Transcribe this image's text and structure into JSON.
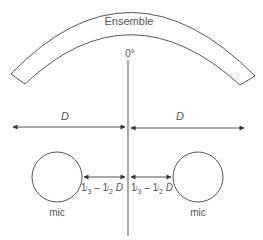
{
  "diagram": {
    "title": "Ensemble",
    "angle_label": "0°",
    "left_distance_label": "D",
    "right_distance_label": "D",
    "left_spacing": {
      "third": "1",
      "third_den": "3",
      "dash": " – ",
      "half": "1",
      "half_den": "2",
      "unit": " D"
    },
    "right_spacing": {
      "third": "1",
      "third_den": "3",
      "dash": " – ",
      "half": "1",
      "half_den": "2",
      "unit": " D"
    },
    "left_mic_label": "mic",
    "right_mic_label": "mic",
    "colors": {
      "line": "#555555",
      "background": "#ffffff"
    }
  }
}
